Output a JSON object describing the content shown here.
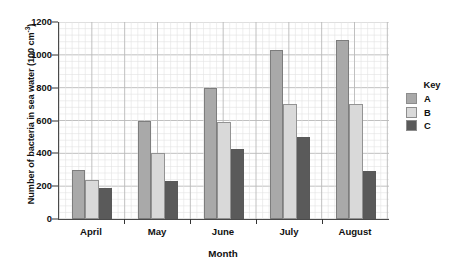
{
  "chart_data": {
    "type": "bar",
    "title": "",
    "categories": [
      "April",
      "May",
      "June",
      "July",
      "August"
    ],
    "series": [
      {
        "name": "A",
        "color": "#a9a9a9",
        "values": [
          300,
          600,
          800,
          1030,
          1090
        ]
      },
      {
        "name": "B",
        "color": "#d9d9d9",
        "values": [
          240,
          400,
          590,
          700,
          700
        ]
      },
      {
        "name": "C",
        "color": "#5a5a5a",
        "values": [
          190,
          230,
          425,
          500,
          290
        ]
      }
    ],
    "xlabel": "Month",
    "ylabel": "Number of bacteria in sea water (100 cm",
    "ylabel_superscript": "-3",
    "ylabel_suffix": ")",
    "ylim": [
      0,
      1200
    ],
    "ytick_step": 200,
    "yticks": [
      0,
      200,
      400,
      600,
      800,
      1000,
      1200
    ],
    "ytick_labels": [
      "0",
      "200",
      "400",
      "600",
      "800",
      "1000",
      "1200"
    ],
    "grid": true,
    "grid_minor_step": 40,
    "legend_position": "right",
    "legend_title": "Key"
  }
}
